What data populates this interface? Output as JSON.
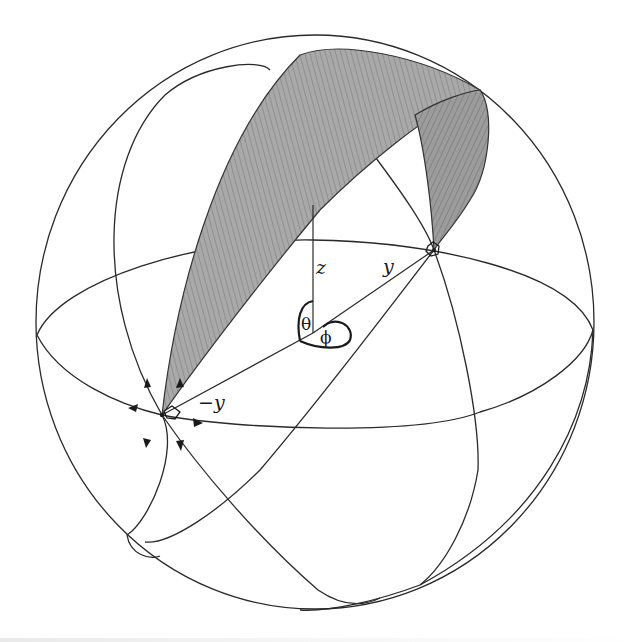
{
  "figure": {
    "type": "spherical-coordinates-diagram",
    "colors": {
      "line": "#2a2a2a",
      "surface_fill": "#a6a6a6",
      "surface_dark": "#7d7d7d",
      "background": "#ffffff"
    },
    "sphere": {
      "cx": 315,
      "cy": 322,
      "rx": 279,
      "ry": 287
    },
    "origin": {
      "x": 313,
      "y": 333
    },
    "points": {
      "plus_y": {
        "x": 434,
        "y": 250
      },
      "minus_y": {
        "x": 162,
        "y": 415
      },
      "z_top": {
        "x": 313,
        "y": 205
      }
    },
    "labels": {
      "z_axis": "z",
      "y_axis": "y",
      "minus_y": "−y",
      "theta": "θ",
      "phi": "ϕ"
    },
    "flow_arrows": {
      "count": 7,
      "direction": "outward from -y point along great circles"
    }
  }
}
